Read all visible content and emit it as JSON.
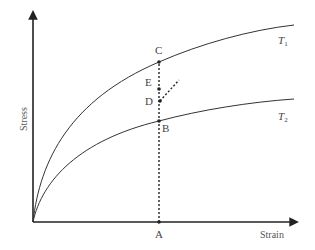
{
  "diagram": {
    "axes": {
      "x_label": "Strain",
      "y_label": "Stress"
    },
    "curves": [
      {
        "id": "T1",
        "label_main": "T",
        "label_sub": "1"
      },
      {
        "id": "T2",
        "label_main": "T",
        "label_sub": "2"
      }
    ],
    "points": {
      "A": "A",
      "B": "B",
      "C": "C",
      "D": "D",
      "E": "E"
    },
    "colors": {
      "line": "#333333",
      "background": "#ffffff"
    }
  }
}
